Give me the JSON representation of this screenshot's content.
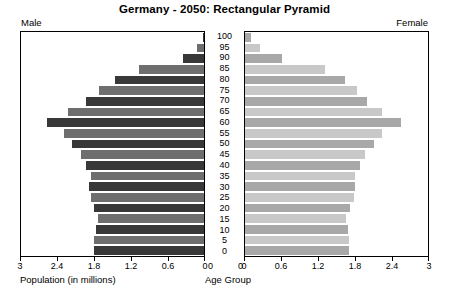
{
  "chart_data": {
    "type": "bar",
    "subtype": "population-pyramid",
    "title": "Germany - 2050: Rectangular Pyramid",
    "xlabel": "Population (in millions)",
    "center_axis_label": "Age Group",
    "categories": [
      "0",
      "5",
      "10",
      "15",
      "20",
      "25",
      "30",
      "35",
      "40",
      "45",
      "50",
      "55",
      "60",
      "65",
      "70",
      "75",
      "80",
      "85",
      "90",
      "95",
      "100"
    ],
    "xlim": [
      0,
      3
    ],
    "xticks": [
      0,
      0.6,
      1.2,
      1.8,
      2.4,
      3
    ],
    "xtick_labels_left": [
      "3",
      "2.4",
      "1.8",
      "1.2",
      "0.6",
      "0"
    ],
    "xtick_labels_right": [
      "0",
      "0.6",
      "1.2",
      "1.8",
      "2.4",
      "3"
    ],
    "grid": false,
    "legend": "none",
    "series": [
      {
        "name": "Male",
        "side": "left",
        "label": "Male",
        "values": [
          1.8,
          1.8,
          1.77,
          1.74,
          1.8,
          1.86,
          1.88,
          1.86,
          1.93,
          2.02,
          2.16,
          2.3,
          2.58,
          2.23,
          1.93,
          1.72,
          1.46,
          1.06,
          0.35,
          0.12,
          0.02
        ]
      },
      {
        "name": "Female",
        "side": "right",
        "label": "Female",
        "values": [
          1.7,
          1.71,
          1.69,
          1.66,
          1.72,
          1.78,
          1.81,
          1.8,
          1.88,
          1.97,
          2.11,
          2.25,
          2.56,
          2.25,
          2.0,
          1.83,
          1.64,
          1.31,
          0.6,
          0.25,
          0.1
        ]
      }
    ],
    "colors": {
      "male_dark": "#383838",
      "male_medium": "#6e6e6e",
      "female_medium": "#a8a8a8",
      "female_light": "#c8c8c8",
      "axis": "#000000",
      "background": "#ffffff"
    }
  },
  "labels": {
    "male_corner": "Male",
    "female_corner": "Female",
    "zero_left": "0",
    "zero_right": "0"
  }
}
